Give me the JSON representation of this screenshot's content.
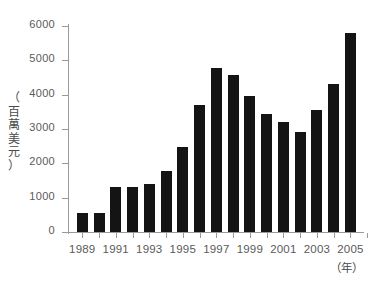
{
  "chart_data": {
    "type": "bar",
    "title": "",
    "subtitle": "",
    "xlabel": "（年）",
    "ylabel": "（百萬美元）",
    "ylabel_chars": [
      "（",
      "百",
      "萬",
      "美",
      "元",
      "）"
    ],
    "categories": [
      "1989",
      "1990",
      "1991",
      "1992",
      "1993",
      "1994",
      "1995",
      "1996",
      "1997",
      "1998",
      "1999",
      "2000",
      "2001",
      "2002",
      "2003",
      "2004",
      "2005"
    ],
    "values": [
      550,
      560,
      1300,
      1320,
      1390,
      1780,
      2480,
      3710,
      4790,
      4560,
      3950,
      3450,
      3200,
      2920,
      3540,
      4300,
      5800
    ],
    "ylim": [
      0,
      6000
    ],
    "yticks": [
      0,
      1000,
      2000,
      3000,
      4000,
      5000,
      6000
    ],
    "ytick_labels": [
      "0",
      "1000",
      "2000",
      "3000",
      "4000",
      "5000",
      "6000"
    ],
    "xtick_labels": [
      "1989",
      "1991",
      "1993",
      "1995",
      "1997",
      "1999",
      "2001",
      "2003",
      "2005"
    ],
    "grid": false,
    "legend": "none",
    "bar_color": "#141414",
    "axis_color": "#9a9a9a",
    "text_color": "#5a5a5a"
  }
}
